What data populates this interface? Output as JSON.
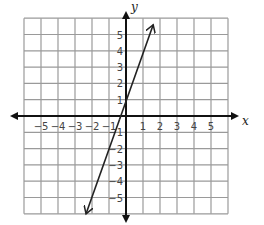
{
  "chart_data": {
    "type": "line",
    "title": "",
    "xlabel": "x",
    "ylabel": "y",
    "xlim": [
      -6,
      6
    ],
    "ylim": [
      -6,
      6
    ],
    "grid": true,
    "x_ticks": [
      "-5",
      "-4",
      "-3",
      "-2",
      "-1",
      "1",
      "2",
      "3",
      "4",
      "5"
    ],
    "y_ticks": [
      "5",
      "4",
      "3",
      "2",
      "1",
      "-1",
      "-2",
      "-3",
      "-4",
      "-5"
    ],
    "series": [
      {
        "name": "line",
        "equation": "y = 3x + 1",
        "slope": 3,
        "intercept": 1,
        "x": [
          -2.35,
          1.6
        ],
        "y": [
          -6,
          5.6
        ],
        "arrows": "both"
      }
    ],
    "colors": {
      "grid": "#9a9a9a",
      "axes": "#111111",
      "line": "#222222"
    }
  }
}
